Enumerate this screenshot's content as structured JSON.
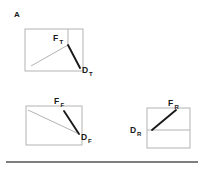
{
  "figure": {
    "panel_letter": "A",
    "background_color": "#ffffff",
    "box_stroke_color": "#b3b3b3",
    "thin_diagonal_color": "#b3b3b3",
    "thick_vector_color": "#1a1a1a",
    "label_color": "#1a1a1a",
    "rule_color": "#555555"
  },
  "diagrams": [
    {
      "id": "top-diagram",
      "name": "thrust-diagram",
      "box": {
        "x": 25,
        "y": 29,
        "width": 58,
        "height": 42
      },
      "inner_vertical_line": {
        "x": 68,
        "y1": 29,
        "y2": 45
      },
      "thin_diagonal": {
        "x1": 31,
        "y1": 66,
        "x2": 68,
        "y2": 45
      },
      "thick_vector": {
        "x1": 68,
        "y1": 45,
        "x2": 80,
        "y2": 68
      },
      "force_label": {
        "base": "F",
        "sub": "T",
        "x": 53,
        "y": 41
      },
      "displacement_label": {
        "base": "D",
        "sub": "T",
        "x": 82,
        "y": 73
      }
    },
    {
      "id": "middle-left-diagram",
      "name": "flap-diagram",
      "box": {
        "x": 26,
        "y": 106,
        "width": 56,
        "height": 39
      },
      "inner_vertical_line": null,
      "thin_diagonal": {
        "x1": 29,
        "y1": 110,
        "x2": 76,
        "y2": 133
      },
      "thick_vector": {
        "x1": 64,
        "y1": 111,
        "x2": 79,
        "y2": 134
      },
      "force_label": {
        "base": "F",
        "sub": "F",
        "x": 55,
        "y": 104
      },
      "displacement_label": {
        "base": "D",
        "sub": "F",
        "x": 82,
        "y": 139
      }
    },
    {
      "id": "right-diagram",
      "name": "rotation-diagram",
      "box": {
        "x": 147,
        "y": 108,
        "width": 43,
        "height": 40
      },
      "inner_horizontal_line": {
        "y": 130,
        "x1": 147,
        "x2": 190
      },
      "thin_diagonal": null,
      "thick_vector": {
        "x1": 152,
        "y1": 130,
        "x2": 176,
        "y2": 110
      },
      "force_label": {
        "base": "F",
        "sub": "R",
        "x": 170,
        "y": 105
      },
      "displacement_label": {
        "base": "D",
        "sub": "R",
        "x": 131,
        "y": 132
      }
    }
  ],
  "bottom_rule": {
    "x1": 6,
    "y1": 162,
    "x2": 198,
    "y2": 162
  }
}
